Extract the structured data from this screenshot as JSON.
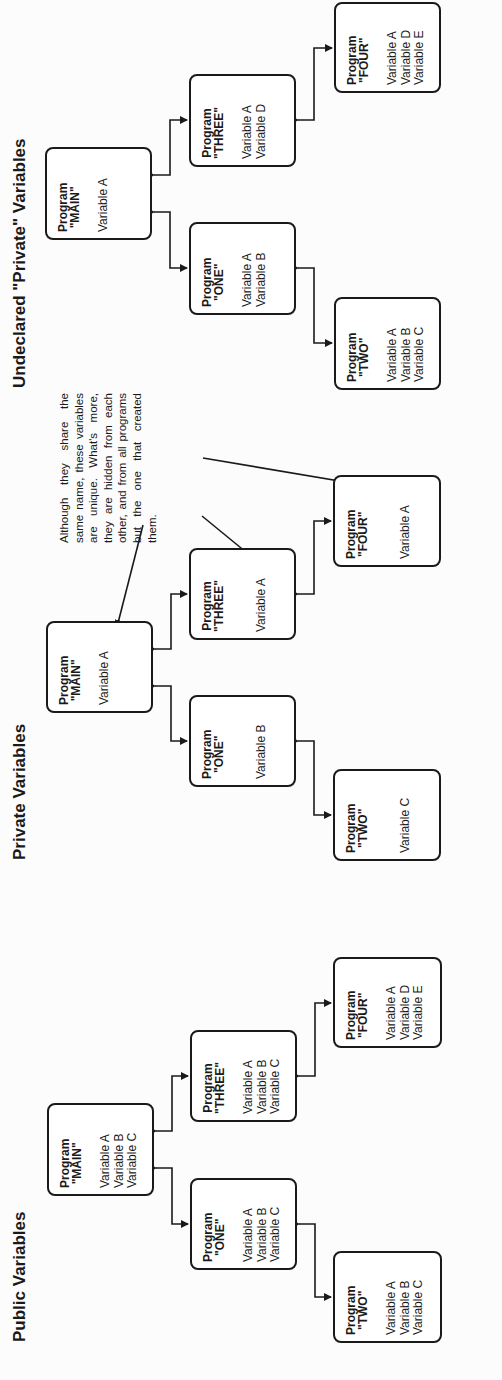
{
  "sections": [
    {
      "title": "Public Variables",
      "programs": {
        "main": {
          "label": "Program",
          "name": "\"MAIN\"",
          "vars": [
            "Variable A",
            "Variable B",
            "Variable C"
          ]
        },
        "one": {
          "label": "Program",
          "name": "\"ONE\"",
          "vars": [
            "Variable A",
            "Variable B",
            "Variable C"
          ]
        },
        "two": {
          "label": "Program",
          "name": "\"TWO\"",
          "vars": [
            "Variable A",
            "Variable B",
            "Variable C"
          ]
        },
        "three": {
          "label": "Program",
          "name": "\"THREE\"",
          "vars": [
            "Variable A",
            "Variable B",
            "Variable C"
          ]
        },
        "four": {
          "label": "Program",
          "name": "\"FOUR\"",
          "vars": [
            "Variable A",
            "Variable D",
            "Variable E"
          ]
        }
      }
    },
    {
      "title": "Private Variables",
      "programs": {
        "main": {
          "label": "Program",
          "name": "\"MAIN\"",
          "vars": [
            "Variable A"
          ]
        },
        "one": {
          "label": "Program",
          "name": "\"ONE\"",
          "vars": [
            "Variable B"
          ]
        },
        "two": {
          "label": "Program",
          "name": "\"TWO\"",
          "vars": [
            "Variable C"
          ]
        },
        "three": {
          "label": "Program",
          "name": "\"THREE\"",
          "vars": [
            "Variable A"
          ]
        },
        "four": {
          "label": "Program",
          "name": "\"FOUR\"",
          "vars": [
            "Variable A"
          ]
        }
      },
      "annotation": "Although they share the same name, these variables are unique. What's more, they are hidden from each other, and from all programs but the one that created them."
    },
    {
      "title": "Undeclared \"Private\" Variables",
      "programs": {
        "main": {
          "label": "Program",
          "name": "\"MAIN\"",
          "vars": [
            "Variable A"
          ]
        },
        "one": {
          "label": "Program",
          "name": "\"ONE\"",
          "vars": [
            "Variable A",
            "Variable B"
          ]
        },
        "two": {
          "label": "Program",
          "name": "\"TWO\"",
          "vars": [
            "Variable A",
            "Variable B",
            "Variable C"
          ]
        },
        "three": {
          "label": "Program",
          "name": "\"THREE\"",
          "vars": [
            "Variable A",
            "Variable D"
          ]
        },
        "four": {
          "label": "Program",
          "name": "\"FOUR\"",
          "vars": [
            "Variable A",
            "Variable D",
            "Variable E"
          ]
        }
      }
    }
  ],
  "colors": {
    "ink": "#1a1a1a",
    "paper": "#fcfcfc"
  }
}
